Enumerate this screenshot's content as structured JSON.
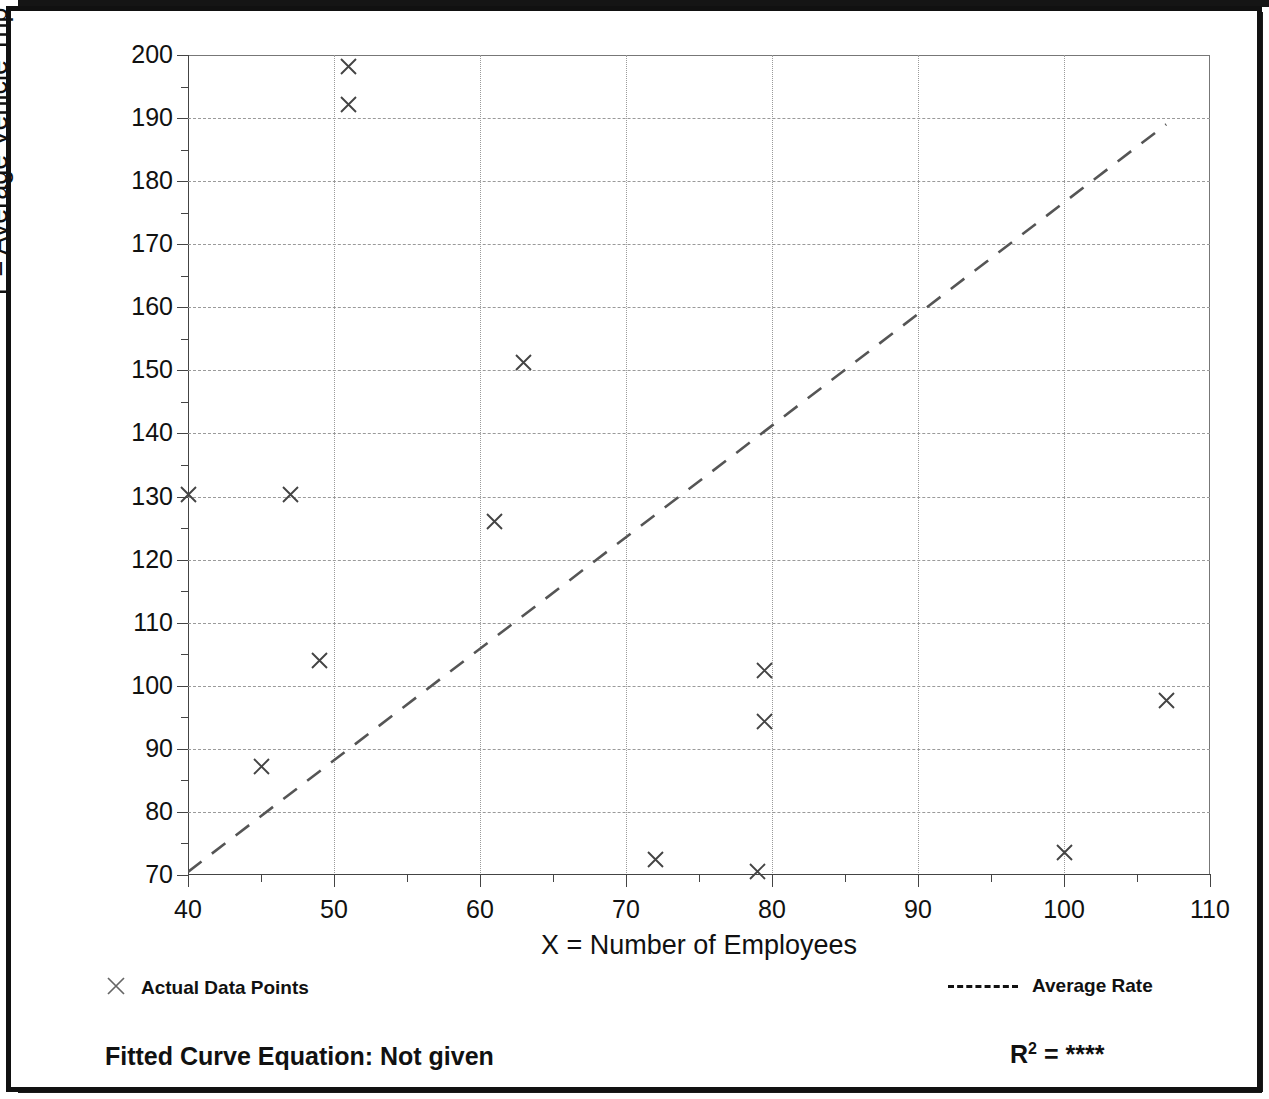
{
  "figure": {
    "y_axis_title": "T = Average Vehicle Trip Ends",
    "x_axis_title": "X = Number of Employees"
  },
  "legend": {
    "actual_label": "Actual Data Points",
    "avg_rate_label": "Average Rate",
    "actual_marker": "x-marker-icon",
    "avg_rate_marker": "dashed-line-icon"
  },
  "footer": {
    "fitted_curve_label": "Fitted Curve Equation:  Not given",
    "r2_prefix": "R",
    "r2_exponent": "2",
    "r2_equals": " = ",
    "r2_value": "****"
  },
  "chart_data": {
    "type": "scatter",
    "title": "",
    "xlabel": "X = Number of Employees",
    "ylabel": "T = Average Vehicle Trip Ends",
    "xlim": [
      40,
      110
    ],
    "ylim": [
      70,
      200
    ],
    "xticks": [
      40,
      50,
      60,
      70,
      80,
      90,
      100,
      110
    ],
    "yticks": [
      70,
      80,
      90,
      100,
      110,
      120,
      130,
      140,
      150,
      160,
      170,
      180,
      190,
      200
    ],
    "xtick_labels": [
      "40",
      "50",
      "60",
      "70",
      "80",
      "90",
      "100",
      "110"
    ],
    "ytick_labels": [
      "70",
      "80",
      "90",
      "100",
      "110",
      "120",
      "130",
      "140",
      "150",
      "160",
      "170",
      "180",
      "190",
      "200"
    ],
    "x_minor_interval": 5,
    "y_minor_interval": 5,
    "grid": true,
    "legend_position": "below-axes",
    "series": [
      {
        "name": "Actual Data Points",
        "type": "scatter",
        "marker": "x",
        "color": "#444444",
        "points": [
          {
            "x": 40,
            "y": 130.3
          },
          {
            "x": 45,
            "y": 87.2
          },
          {
            "x": 47,
            "y": 130.3
          },
          {
            "x": 49,
            "y": 104.0
          },
          {
            "x": 51,
            "y": 198.2
          },
          {
            "x": 51,
            "y": 192.2
          },
          {
            "x": 61,
            "y": 126.0
          },
          {
            "x": 63,
            "y": 151.2
          },
          {
            "x": 72,
            "y": 72.5
          },
          {
            "x": 79,
            "y": 70.5
          },
          {
            "x": 79.5,
            "y": 102.5
          },
          {
            "x": 79.5,
            "y": 94.4
          },
          {
            "x": 100,
            "y": 73.5
          },
          {
            "x": 107,
            "y": 97.6
          }
        ]
      },
      {
        "name": "Average Rate",
        "type": "line",
        "style": "dashed",
        "color": "#555555",
        "points": [
          {
            "x": 40,
            "y": 70.5
          },
          {
            "x": 107,
            "y": 189.0
          }
        ]
      }
    ]
  }
}
